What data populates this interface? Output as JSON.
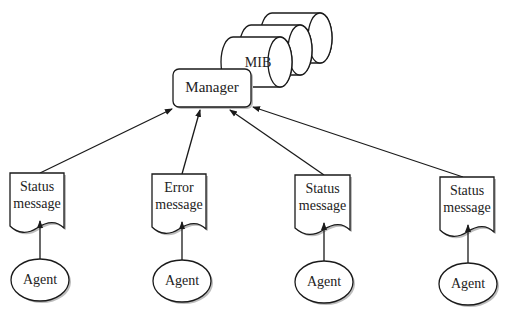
{
  "diagram": {
    "type": "network-management-architecture",
    "database": {
      "label": "MIB",
      "shape": "stacked-cylinders",
      "count": 3
    },
    "manager": {
      "label": "Manager"
    },
    "messages": [
      {
        "line1": "Status",
        "line2": "message",
        "kind": "status"
      },
      {
        "line1": "Error",
        "line2": "message",
        "kind": "error"
      },
      {
        "line1": "Status",
        "line2": "message",
        "kind": "status"
      },
      {
        "line1": "Status",
        "line2": "message",
        "kind": "status"
      }
    ],
    "agents": [
      {
        "label": "Agent"
      },
      {
        "label": "Agent"
      },
      {
        "label": "Agent"
      },
      {
        "label": "Agent"
      }
    ],
    "edges": [
      {
        "from": "agent-1",
        "to": "message-1"
      },
      {
        "from": "agent-2",
        "to": "message-2"
      },
      {
        "from": "agent-3",
        "to": "message-3"
      },
      {
        "from": "agent-4",
        "to": "message-4"
      },
      {
        "from": "message-1",
        "to": "manager"
      },
      {
        "from": "message-2",
        "to": "manager"
      },
      {
        "from": "message-3",
        "to": "manager"
      },
      {
        "from": "message-4",
        "to": "manager"
      }
    ],
    "colors": {
      "stroke": "#1a1a1a",
      "fill": "#ffffff",
      "shadow": "#bdbdbd"
    }
  }
}
